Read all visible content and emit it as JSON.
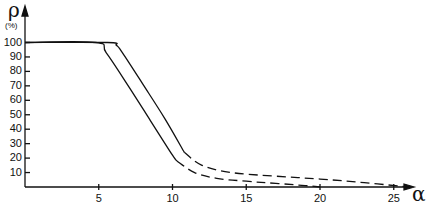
{
  "chart_data": {
    "type": "line",
    "title": "",
    "ylabel": "ρ",
    "yunit": "(%)",
    "xlabel": "α",
    "xlim": [
      0,
      27
    ],
    "ylim": [
      0,
      105
    ],
    "xticks": [
      5,
      10,
      15,
      20,
      25
    ],
    "yticks": [
      10,
      20,
      30,
      40,
      50,
      60,
      70,
      80,
      90,
      100
    ],
    "grid": false,
    "legend": null,
    "series": [
      {
        "name": "curve-left",
        "solid": {
          "x": [
            0,
            4.8,
            5.5,
            7,
            8.5,
            10,
            10.3
          ],
          "y": [
            100,
            100,
            93,
            70,
            46,
            22,
            18
          ]
        },
        "dashed": {
          "x": [
            10.3,
            11.5,
            13,
            15,
            17,
            19,
            20
          ],
          "y": [
            18,
            10,
            6,
            4,
            2.5,
            1,
            0
          ]
        }
      },
      {
        "name": "curve-right",
        "solid": {
          "x": [
            0,
            5.6,
            6.2,
            6.6,
            8,
            9.5,
            10.8
          ],
          "y": [
            100,
            100,
            98,
            93,
            71,
            47,
            24
          ]
        },
        "dashed": {
          "x": [
            10.8,
            12,
            14,
            17,
            20,
            23,
            26
          ],
          "y": [
            24,
            15,
            10,
            7.5,
            5.5,
            3,
            0
          ]
        }
      }
    ]
  },
  "axis": {
    "y_symbol": "ρ",
    "y_unit": "(%)",
    "x_symbol": "α",
    "y_tick_labels": [
      "100",
      "90",
      "80",
      "70",
      "60",
      "50",
      "40",
      "30",
      "20",
      "10"
    ],
    "x_tick_labels": [
      "5",
      "10",
      "15",
      "20",
      "25"
    ]
  }
}
